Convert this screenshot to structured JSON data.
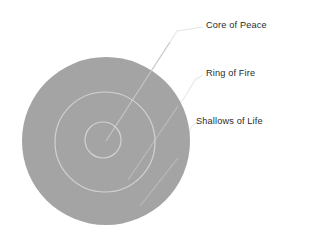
{
  "diagram": {
    "type": "concentric-target",
    "background_color": "#ffffff",
    "fill_color": "#a5a5a5",
    "ring_stroke_color": "#d4d4d4",
    "leader_line_color": "#e2e2e2",
    "label_text_color": "#2b2b2b",
    "center": {
      "x": 106,
      "y": 141
    },
    "rings": [
      {
        "id": "outer",
        "name": "Shallows of Life",
        "label": "Shallows of Life",
        "radius": 84,
        "filled": true
      },
      {
        "id": "middle",
        "name": "Ring of Fire",
        "label": "Ring of Fire",
        "radius": 50,
        "filled": false
      },
      {
        "id": "inner",
        "name": "Core of Peace",
        "label": "Core of Peace",
        "radius": 18,
        "filled": false
      }
    ]
  },
  "labels": {
    "core": "Core of Peace",
    "ring": "Ring of Fire",
    "shallows": "Shallows of Life"
  }
}
